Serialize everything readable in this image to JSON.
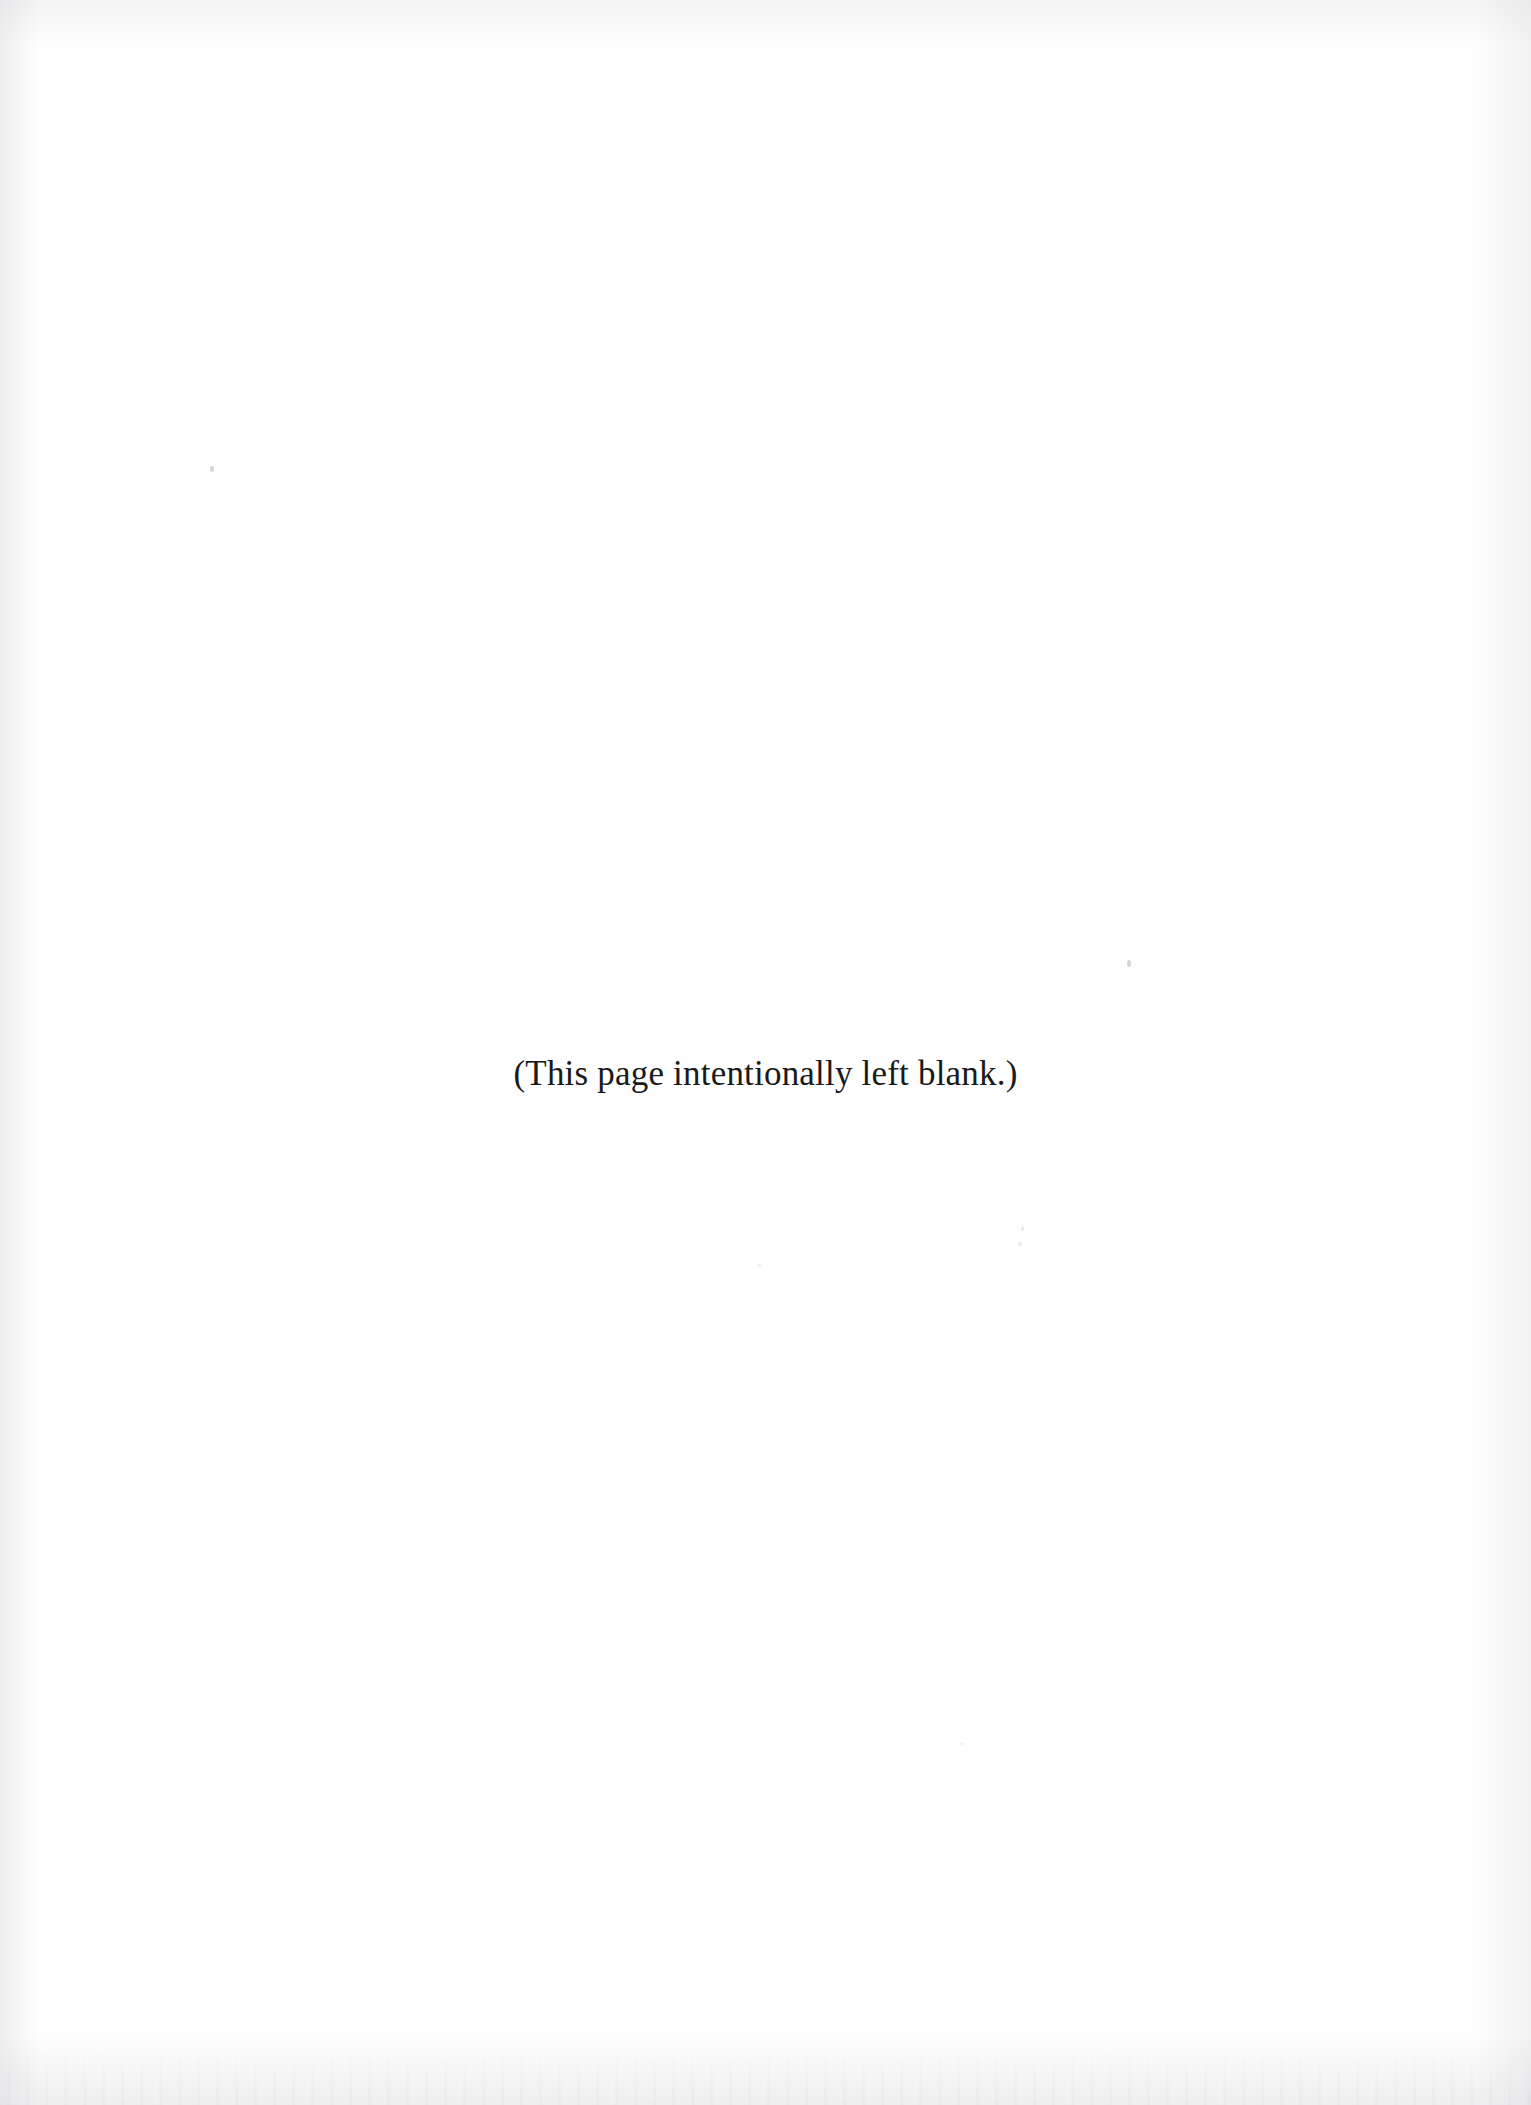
{
  "page": {
    "kind": "scanned-document-page",
    "background_color": "#fefefe",
    "text_color": "#1a1a1a",
    "width_px": 1531,
    "height_px": 2105
  },
  "content": {
    "notice": "(This page intentionally left blank.)"
  },
  "artifacts": {
    "edge_shading_color": "#cdced2",
    "speck_color": "#78787f",
    "description": "faint scanner shading at page edges and a few dust specks"
  }
}
